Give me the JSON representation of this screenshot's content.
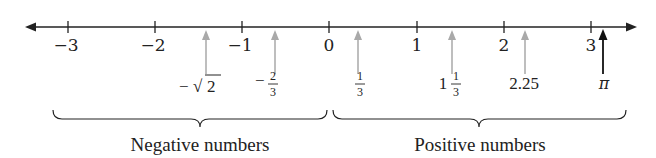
{
  "diagram": {
    "type": "number-line",
    "axis": {
      "min": -3,
      "max": 3,
      "arrows": "both",
      "ticks": [
        {
          "value": -3,
          "label": "−3"
        },
        {
          "value": -2,
          "label": "−2"
        },
        {
          "value": -1,
          "label": "−1"
        },
        {
          "value": 0,
          "label": "0"
        },
        {
          "value": 1,
          "label": "1"
        },
        {
          "value": 2,
          "label": "2"
        },
        {
          "value": 3,
          "label": "3"
        }
      ]
    },
    "points": [
      {
        "name": "negative-sqrt2",
        "value": -1.414,
        "label_sign": "−",
        "label_radical": "√",
        "label_radicand": "2",
        "color": "#a9a9a9"
      },
      {
        "name": "negative-two-thirds",
        "value": -0.667,
        "label_sign": "−",
        "numerator": "2",
        "denominator": "3",
        "color": "#a9a9a9"
      },
      {
        "name": "one-third",
        "value": 0.333,
        "numerator": "1",
        "denominator": "3",
        "color": "#a9a9a9"
      },
      {
        "name": "one-and-one-third",
        "value": 1.333,
        "whole": "1",
        "numerator": "1",
        "denominator": "3",
        "color": "#a9a9a9"
      },
      {
        "name": "two-point-two-five",
        "value": 2.25,
        "label": "2.25",
        "color": "#a9a9a9"
      },
      {
        "name": "pi",
        "value": 3.14159,
        "label": "π",
        "color": "#111111"
      }
    ],
    "braces": [
      {
        "label": "Negative numbers",
        "from": -3.3,
        "to": 0
      },
      {
        "label": "Positive numbers",
        "from": 0,
        "to": 3.4
      }
    ],
    "colors": {
      "axis": "#222222",
      "highlight_arrow": "#111111",
      "point_arrow": "#a9a9a9"
    }
  }
}
